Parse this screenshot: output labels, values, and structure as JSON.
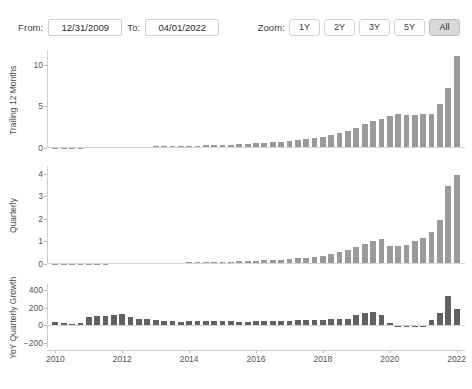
{
  "toolbar": {
    "from_label": "From:",
    "from_value": "12/31/2009",
    "to_label": "To:",
    "to_value": "04/01/2022",
    "zoom_label": "Zoom:",
    "zoom_options": [
      "1Y",
      "2Y",
      "3Y",
      "5Y",
      "All"
    ],
    "zoom_selected": "All"
  },
  "colors": {
    "bar": "#9a9a9a",
    "bar_dark": "#616161",
    "axis": "#d0d0d0",
    "text": "#555555"
  },
  "chart_data": [
    {
      "type": "bar",
      "title": "",
      "ylabel": "Trailing 12 Months",
      "xlabel": "",
      "ylim": [
        0,
        11.8
      ],
      "yticks": [
        0,
        5,
        10
      ],
      "ytick_labels": [
        "0",
        "5",
        "10"
      ],
      "xlim": [
        2009.75,
        2022.25
      ],
      "xticks": [
        2010,
        2012,
        2014,
        2016,
        2018,
        2020,
        2022
      ],
      "xtick_labels": [
        "2010",
        "2012",
        "2014",
        "2016",
        "2018",
        "2020",
        "2022"
      ],
      "grid": false,
      "legend": "none",
      "x": [
        2010.0,
        2010.25,
        2010.5,
        2010.75,
        2011.0,
        2011.25,
        2011.5,
        2011.75,
        2012.0,
        2012.25,
        2012.5,
        2012.75,
        2013.0,
        2013.25,
        2013.5,
        2013.75,
        2014.0,
        2014.25,
        2014.5,
        2014.75,
        2015.0,
        2015.25,
        2015.5,
        2015.75,
        2016.0,
        2016.25,
        2016.5,
        2016.75,
        2017.0,
        2017.25,
        2017.5,
        2017.75,
        2018.0,
        2018.25,
        2018.5,
        2018.75,
        2019.0,
        2019.25,
        2019.5,
        2019.75,
        2020.0,
        2020.25,
        2020.5,
        2020.75,
        2021.0,
        2021.25,
        2021.5,
        2021.75,
        2022.0
      ],
      "values": [
        0.05,
        0.06,
        0.07,
        0.08,
        0.1,
        0.11,
        0.12,
        0.13,
        0.14,
        0.15,
        0.16,
        0.17,
        0.19,
        0.2,
        0.22,
        0.24,
        0.26,
        0.28,
        0.31,
        0.34,
        0.38,
        0.42,
        0.46,
        0.5,
        0.56,
        0.62,
        0.68,
        0.75,
        0.85,
        0.95,
        1.05,
        1.18,
        1.35,
        1.55,
        1.8,
        2.1,
        2.45,
        2.85,
        3.25,
        3.55,
        3.85,
        4.05,
        4.0,
        3.95,
        4.05,
        4.1,
        5.3,
        7.2,
        11.1
      ]
    },
    {
      "type": "bar",
      "title": "",
      "ylabel": "Quarterly",
      "xlabel": "",
      "ylim": [
        0,
        4.35
      ],
      "yticks": [
        0,
        1,
        2,
        3,
        4
      ],
      "ytick_labels": [
        "0",
        "1",
        "2",
        "3",
        "4"
      ],
      "xlim": [
        2009.75,
        2022.25
      ],
      "xticks": [
        2010,
        2012,
        2014,
        2016,
        2018,
        2020,
        2022
      ],
      "xtick_labels": [
        "2010",
        "2012",
        "2014",
        "2016",
        "2018",
        "2020",
        "2022"
      ],
      "grid": false,
      "legend": "none",
      "x": [
        2010.0,
        2010.25,
        2010.5,
        2010.75,
        2011.0,
        2011.25,
        2011.5,
        2011.75,
        2012.0,
        2012.25,
        2012.5,
        2012.75,
        2013.0,
        2013.25,
        2013.5,
        2013.75,
        2014.0,
        2014.25,
        2014.5,
        2014.75,
        2015.0,
        2015.25,
        2015.5,
        2015.75,
        2016.0,
        2016.25,
        2016.5,
        2016.75,
        2017.0,
        2017.25,
        2017.5,
        2017.75,
        2018.0,
        2018.25,
        2018.5,
        2018.75,
        2019.0,
        2019.25,
        2019.5,
        2019.75,
        2020.0,
        2020.25,
        2020.5,
        2020.75,
        2021.0,
        2021.25,
        2021.5,
        2021.75,
        2022.0
      ],
      "values": [
        0.015,
        0.018,
        0.02,
        0.022,
        0.025,
        0.028,
        0.03,
        0.032,
        0.035,
        0.038,
        0.041,
        0.044,
        0.048,
        0.052,
        0.057,
        0.062,
        0.068,
        0.074,
        0.081,
        0.089,
        0.098,
        0.108,
        0.119,
        0.131,
        0.145,
        0.16,
        0.177,
        0.195,
        0.22,
        0.25,
        0.28,
        0.32,
        0.37,
        0.44,
        0.52,
        0.62,
        0.74,
        0.88,
        1.02,
        1.12,
        0.82,
        0.78,
        0.86,
        1.04,
        1.16,
        1.42,
        1.95,
        3.45,
        3.95
      ]
    },
    {
      "type": "bar",
      "title": "",
      "ylabel": "YoY Quarterly Growth",
      "xlabel": "",
      "ylim": [
        -260,
        470
      ],
      "yticks": [
        -200,
        0,
        200,
        400
      ],
      "ytick_labels": [
        "−200",
        "0",
        "200",
        "400"
      ],
      "xlim": [
        2009.75,
        2022.25
      ],
      "xticks": [
        2010,
        2012,
        2014,
        2016,
        2018,
        2020,
        2022
      ],
      "xtick_labels": [
        "2010",
        "2012",
        "2014",
        "2016",
        "2018",
        "2020",
        "2022"
      ],
      "grid": false,
      "legend": "none",
      "x": [
        2010.0,
        2010.25,
        2010.5,
        2010.75,
        2011.0,
        2011.25,
        2011.5,
        2011.75,
        2012.0,
        2012.25,
        2012.5,
        2012.75,
        2013.0,
        2013.25,
        2013.5,
        2013.75,
        2014.0,
        2014.25,
        2014.5,
        2014.75,
        2015.0,
        2015.25,
        2015.5,
        2015.75,
        2016.0,
        2016.25,
        2016.5,
        2016.75,
        2017.0,
        2017.25,
        2017.5,
        2017.75,
        2018.0,
        2018.25,
        2018.5,
        2018.75,
        2019.0,
        2019.25,
        2019.5,
        2019.75,
        2020.0,
        2020.25,
        2020.5,
        2020.75,
        2021.0,
        2021.25,
        2021.5,
        2021.75,
        2022.0
      ],
      "values": [
        35,
        22,
        18,
        20,
        95,
        110,
        105,
        118,
        125,
        88,
        72,
        70,
        55,
        48,
        45,
        42,
        44,
        46,
        48,
        50,
        46,
        44,
        42,
        40,
        44,
        46,
        48,
        46,
        52,
        56,
        58,
        60,
        62,
        66,
        70,
        72,
        120,
        140,
        155,
        120,
        28,
        -18,
        -22,
        -20,
        -15,
        55,
        140,
        330,
        190
      ]
    }
  ]
}
